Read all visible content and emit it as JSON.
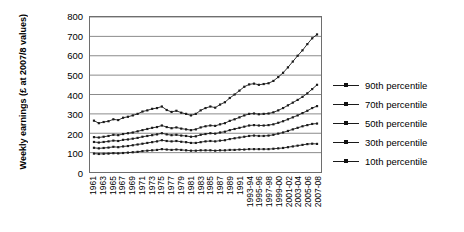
{
  "chart_data": {
    "type": "line",
    "title": "",
    "xlabel": "",
    "ylabel": "Weekly earnings (£ at 2007/8 values)",
    "ylim": [
      0,
      800
    ],
    "ytick_values": [
      0,
      100,
      200,
      300,
      400,
      500,
      600,
      700,
      800
    ],
    "ytick_labels": [
      "0",
      "100",
      "200",
      "300",
      "400",
      "500",
      "600",
      "700",
      "800"
    ],
    "grid": "horizontal",
    "legend_position": "right",
    "marker": "small-square",
    "line_color": "#1a1a1a",
    "grid_color": "#8a8a8a",
    "border_color": "#6e6e6e",
    "categories": [
      "1961",
      "1962",
      "1963",
      "1964",
      "1965",
      "1966",
      "1967",
      "1968",
      "1969",
      "1970",
      "1971",
      "1972",
      "1973",
      "1974",
      "1975",
      "1976",
      "1977",
      "1978",
      "1979",
      "1980",
      "1981",
      "1982",
      "1983",
      "1984",
      "1985",
      "1986",
      "1987",
      "1988",
      "1989",
      "1990",
      "1991",
      "1992",
      "1993-94",
      "1994-95",
      "1995-96",
      "1996-97",
      "1997-98",
      "1998-99",
      "1999-00",
      "2000-01",
      "2001-02",
      "2002-03",
      "2003-04",
      "2004-05",
      "2005-06",
      "2006-07",
      "2007-08"
    ],
    "xtick_labels": [
      "1961",
      "1963",
      "1965",
      "1967",
      "1969",
      "1971",
      "1973",
      "1975",
      "1977",
      "1979",
      "1981",
      "1983",
      "1985",
      "1987",
      "1989",
      "1991",
      "1993-94",
      "1995-96",
      "1997-98",
      "1999-00",
      "2001-02",
      "2003-04",
      "2005-06",
      "2007-08"
    ],
    "xtick_indices": [
      0,
      2,
      4,
      6,
      8,
      10,
      12,
      14,
      16,
      18,
      20,
      22,
      24,
      26,
      28,
      30,
      32,
      34,
      36,
      38,
      40,
      42,
      44,
      46
    ],
    "series": [
      {
        "name": "90th percentile",
        "values": [
          265,
          252,
          258,
          262,
          272,
          268,
          280,
          285,
          292,
          300,
          312,
          318,
          326,
          330,
          338,
          320,
          310,
          316,
          306,
          300,
          292,
          300,
          318,
          330,
          338,
          332,
          348,
          360,
          382,
          400,
          420,
          440,
          452,
          456,
          450,
          454,
          458,
          470,
          490,
          512,
          540,
          570,
          600,
          628,
          660,
          690,
          710
        ]
      },
      {
        "name": "70th percentile",
        "values": [
          180,
          178,
          182,
          186,
          192,
          190,
          196,
          200,
          204,
          210,
          216,
          222,
          228,
          232,
          240,
          232,
          226,
          230,
          224,
          220,
          216,
          220,
          230,
          236,
          240,
          238,
          246,
          252,
          264,
          272,
          282,
          292,
          300,
          302,
          298,
          300,
          302,
          308,
          318,
          330,
          344,
          358,
          372,
          388,
          406,
          428,
          450
        ]
      },
      {
        "name": "50th percentile",
        "values": [
          155,
          152,
          155,
          158,
          162,
          160,
          166,
          168,
          172,
          176,
          182,
          186,
          190,
          194,
          200,
          194,
          190,
          192,
          188,
          186,
          182,
          184,
          192,
          196,
          200,
          198,
          204,
          208,
          216,
          222,
          228,
          234,
          240,
          242,
          240,
          240,
          242,
          246,
          254,
          262,
          272,
          282,
          292,
          304,
          316,
          330,
          340
        ]
      },
      {
        "name": "30th percentile",
        "values": [
          125,
          122,
          124,
          126,
          130,
          128,
          132,
          134,
          138,
          142,
          146,
          150,
          154,
          158,
          164,
          160,
          158,
          160,
          156,
          154,
          150,
          150,
          154,
          158,
          160,
          158,
          162,
          164,
          170,
          174,
          178,
          182,
          186,
          188,
          186,
          186,
          188,
          192,
          198,
          204,
          212,
          220,
          228,
          236,
          242,
          248,
          250
        ]
      },
      {
        "name": "10th percentile",
        "values": [
          95,
          93,
          94,
          95,
          97,
          96,
          98,
          100,
          102,
          104,
          108,
          110,
          112,
          114,
          118,
          116,
          114,
          116,
          114,
          112,
          110,
          110,
          112,
          112,
          112,
          110,
          112,
          112,
          114,
          114,
          116,
          116,
          118,
          118,
          118,
          118,
          118,
          120,
          122,
          124,
          128,
          132,
          136,
          140,
          144,
          146,
          145
        ]
      }
    ]
  },
  "legend": {
    "items": [
      {
        "label": "90th percentile"
      },
      {
        "label": "70th percentile"
      },
      {
        "label": "50th percentile"
      },
      {
        "label": "30th percentile"
      },
      {
        "label": "10th percentile"
      }
    ]
  }
}
